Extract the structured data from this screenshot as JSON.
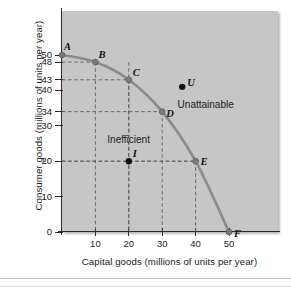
{
  "chart_data": {
    "type": "line",
    "title": "",
    "xlabel": "Capital goods (millions of units per year)",
    "ylabel": "Consumer goods (millions of units per year)",
    "xlim": [
      0,
      55
    ],
    "ylim": [
      0,
      55
    ],
    "xticks": [
      10,
      20,
      30,
      40,
      50
    ],
    "xtick_labels": [
      "10",
      "20",
      "30",
      "40",
      "50"
    ],
    "yticks": [
      0,
      10,
      20,
      30,
      34,
      40,
      43,
      48,
      50
    ],
    "ytick_labels": [
      "0",
      "10",
      "20",
      "30",
      "34",
      "40",
      "43",
      "48",
      "50"
    ],
    "grid": false,
    "legend": "none",
    "series": [
      {
        "name": "Production possibilities frontier",
        "color": "#8a8a8a",
        "x": [
          0,
          10,
          20,
          30,
          40,
          50
        ],
        "values": [
          50,
          48,
          43,
          34,
          20,
          0
        ]
      }
    ],
    "frontier_points": [
      {
        "label": "A",
        "x": 0,
        "y": 50,
        "on_curve": true
      },
      {
        "label": "B",
        "x": 10,
        "y": 48,
        "on_curve": true
      },
      {
        "label": "C",
        "x": 20,
        "y": 43,
        "on_curve": true
      },
      {
        "label": "D",
        "x": 30,
        "y": 34,
        "on_curve": true
      },
      {
        "label": "E",
        "x": 40,
        "y": 20,
        "on_curve": true
      },
      {
        "label": "F",
        "x": 50,
        "y": 0,
        "on_curve": true
      }
    ],
    "other_points": [
      {
        "label": "I",
        "x": 20,
        "y": 20,
        "region": "Inefficient"
      },
      {
        "label": "U",
        "x": 36,
        "y": 41,
        "region": "Unattainable"
      }
    ],
    "annotations": [
      {
        "text": "Inefficient",
        "x": 20,
        "y": 26
      },
      {
        "text": "Unattainable",
        "x": 43,
        "y": 36
      }
    ],
    "dashed_guides": {
      "note": "dashed lines drop from B, C, D, E and I to both axes",
      "color": "#5a5a5a"
    },
    "plot_background": "#c6c6c6",
    "axis_color": "#2b2b2b",
    "curve_color": "#8a8a8a"
  }
}
